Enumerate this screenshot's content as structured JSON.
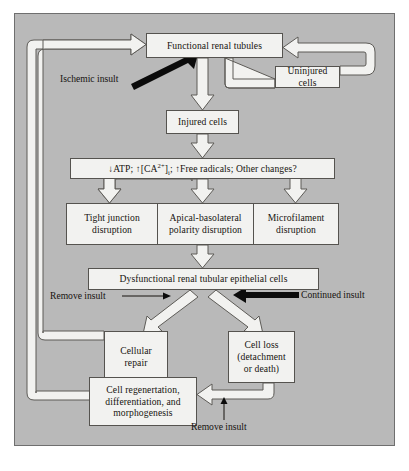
{
  "diagram": {
    "frame": {
      "background_color": "#b9b9b9",
      "border_color": "#6f6f6f"
    },
    "node_style": {
      "fill": "#f2f2f0",
      "stroke": "#55534f",
      "text_color": "#16120f"
    },
    "arrow_style": {
      "hollow_fill": "#f2f2f0",
      "hollow_stroke": "#5d5b57",
      "solid_fill": "#000000"
    },
    "nodes": [
      {
        "id": "functional",
        "label": "Functional renal tubules"
      },
      {
        "id": "uninjured",
        "label": "Uninjured cells"
      },
      {
        "id": "injured",
        "label": "Injured cells"
      },
      {
        "id": "biochem",
        "label": "↓ATP; ↑[CA",
        "label_sup": "2+",
        "label_sub": "i",
        "label_tail": "; ↑Free radicals; Other changes?"
      },
      {
        "id": "tight",
        "label": "Tight junction\ndisruption"
      },
      {
        "id": "apical",
        "label": "Apical-basolateral\npolarity disruption"
      },
      {
        "id": "microfil",
        "label": "Microfilament\ndisruption"
      },
      {
        "id": "dysfunctional",
        "label": "Dysfunctional renal tubular epithelial cells"
      },
      {
        "id": "repair",
        "label": "Cellular\nrepair"
      },
      {
        "id": "cellloss",
        "label": "Cell loss\n(detachment\nor death)"
      },
      {
        "id": "regen",
        "label": "Cell regenertation,\ndifferentiation, and\nmorphogenesis"
      }
    ],
    "captions": [
      {
        "id": "ischemic",
        "label": "Ischemic insult"
      },
      {
        "id": "remove-insult-1",
        "label": "Remove insult"
      },
      {
        "id": "continued",
        "label": "Continued insult"
      },
      {
        "id": "remove-insult-2",
        "label": "Remove insult"
      }
    ],
    "node_text": {
      "functional": "Functional renal tubules",
      "uninjured": "Uninjured cells",
      "injured": "Injured cells",
      "biochem_pre": "↓ATP; ↑[CA",
      "biochem_sup": "2+",
      "biochem_close": "]",
      "biochem_sub": "i",
      "biochem_post": "; ↑Free radicals; Other changes?",
      "tight_l1": "Tight junction",
      "tight_l2": "disruption",
      "apical_l1": "Apical-basolateral",
      "apical_l2": "polarity disruption",
      "microfil_l1": "Microfilament",
      "microfil_l2": "disruption",
      "dysfunctional": "Dysfunctional renal tubular epithelial cells",
      "repair_l1": "Cellular",
      "repair_l2": "repair",
      "cellloss_l1": "Cell loss",
      "cellloss_l2": "(detachment",
      "cellloss_l3": "or death)",
      "regen_l1": "Cell regenertation,",
      "regen_l2": "differentiation, and",
      "regen_l3": "morphogenesis"
    },
    "caption_text": {
      "ischemic": "Ischemic insult",
      "remove_insult_left": "Remove insult",
      "continued_insult": "Continued insult",
      "remove_insult_bottom": "Remove insult"
    }
  }
}
